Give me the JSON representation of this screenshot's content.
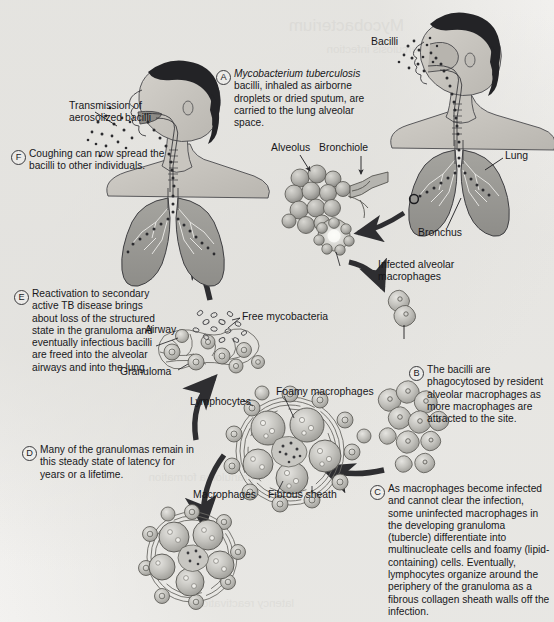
{
  "figure": {
    "background_color": "#f2f1ef",
    "ink_color": "#17171a",
    "tissue_fill": "#a9a8a4",
    "lung_fill": "#9b9a96",
    "skin_fill": "#c9c6c0",
    "hair_fill": "#232326",
    "cell_fill": "#b8b7b2",
    "arrow_color": "#2e2e31"
  },
  "bleed_through_text": [
    "Mycobacterium",
    "tuberculosis infection",
    "granuloma formation",
    "latency reactivation"
  ],
  "steps": [
    {
      "id": "A",
      "letter": "A",
      "name": "inhalation",
      "text_runs": [
        {
          "style": "italic",
          "text": "Mycobacterium tuberculosis"
        },
        {
          "style": "normal",
          "text": " bacilli, inhaled as airborne droplets or dried sputum, are carried to the lung alveolar space."
        }
      ]
    },
    {
      "id": "B",
      "letter": "B",
      "name": "phagocytosis",
      "text_runs": [
        {
          "style": "normal",
          "text": "The bacilli are phagocytosed by resident alveolar macrophages as more macrophages are attracted to the site."
        }
      ]
    },
    {
      "id": "C",
      "letter": "C",
      "name": "granuloma-formation",
      "text_runs": [
        {
          "style": "normal",
          "text": "As macrophages become infected and cannot clear the infection, some uninfected macrophages in the developing granuloma (tubercle) differentiate into multinucleate cells and foamy (lipid-containing) cells. Eventually, lymphocytes organize around the periphery of the granuloma as a fibrous collagen sheath walls off the infection."
        }
      ]
    },
    {
      "id": "D",
      "letter": "D",
      "name": "latency",
      "text_runs": [
        {
          "style": "normal",
          "text": "Many of the granulomas remain in this steady state of latency for years or a lifetime."
        }
      ]
    },
    {
      "id": "E",
      "letter": "E",
      "name": "reactivation",
      "text_runs": [
        {
          "style": "normal",
          "text": "Reactivation to secondary active TB disease brings about loss of the structured state in the granuloma and eventually infectious bacilli are freed into the alveolar airways and into the lung."
        }
      ]
    },
    {
      "id": "F",
      "letter": "F",
      "name": "transmission",
      "text_runs": [
        {
          "style": "normal",
          "text": "Coughing can now spread the bacilli to other individuals."
        }
      ]
    }
  ],
  "labels": {
    "bacilli": "Bacilli",
    "alveolus": "Alveolus",
    "bronchiole": "Bronchiole",
    "lung": "Lung",
    "bronchus": "Bronchus",
    "infected_alveolar_macrophages": "Infected alveolar\nmacrophages",
    "transmission_of_aerosolized_bacilli": "Transmission of\naerosolized bacilli",
    "airway": "Airway",
    "granuloma": "Granuloma",
    "free_mycobacteria": "Free mycobacteria",
    "foamy_macrophages": "Foamy macrophages",
    "lymphocytes": "Lymphocytes",
    "macrophages": "Macrophages",
    "fibrous_sheath": "Fibrous sheath"
  }
}
